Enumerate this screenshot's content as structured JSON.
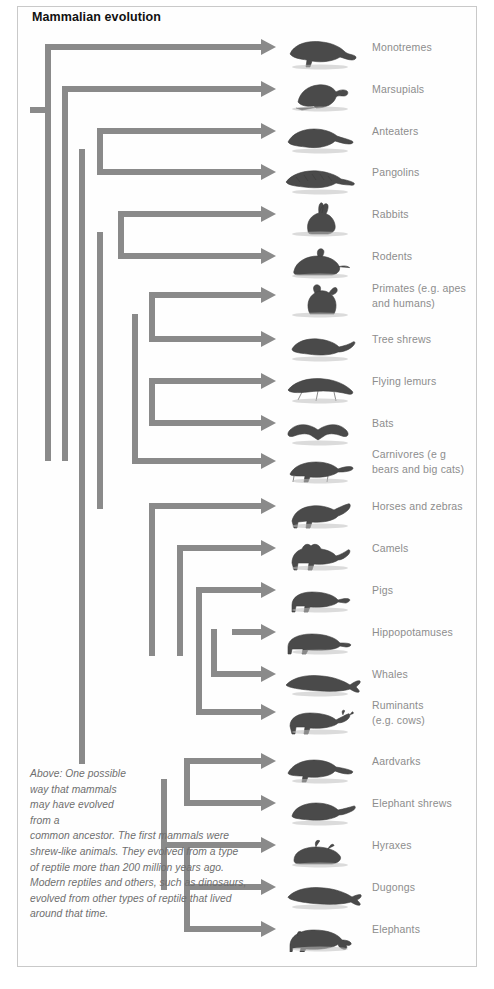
{
  "figure": {
    "title": "Mammalian evolution",
    "caption_narrow": "Above: One possible way that mammals may have evolved from a",
    "caption_rest": "common ancestor. The first mammals were shrew-like animals. They evolved from a type of reptile more than 200 million years ago. Modern reptiles and others, such as dinosaurs, evolved from other types of reptile that lived around that time.",
    "border_color": "#c9c9c9",
    "branch_color": "#8a8a8a",
    "label_color": "#8d8d8d",
    "title_color": "#111111",
    "caption_color": "#6f6f6f",
    "background": "#ffffff"
  },
  "chart_data": {
    "type": "diagram",
    "diagram_kind": "cladogram",
    "title": "Mammalian evolution",
    "taxa": [
      {
        "id": "monotremes",
        "label_line1": "Monotremes",
        "label_line2": "",
        "y": 47,
        "branch_x": 48,
        "animal": "platypus"
      },
      {
        "id": "marsupials",
        "label_line1": "Marsupials",
        "label_line2": "",
        "y": 89,
        "branch_x": 65,
        "animal": "marsupial"
      },
      {
        "id": "anteaters",
        "label_line1": "Anteaters",
        "label_line2": "",
        "y": 131,
        "branch_x": 100,
        "animal": "anteater"
      },
      {
        "id": "pangolins",
        "label_line1": "Pangolins",
        "label_line2": "",
        "y": 172,
        "branch_x": 100,
        "animal": "pangolin"
      },
      {
        "id": "rabbits",
        "label_line1": "Rabbits",
        "label_line2": "",
        "y": 214,
        "branch_x": 121,
        "animal": "rabbit"
      },
      {
        "id": "rodents",
        "label_line1": "Rodents",
        "label_line2": "",
        "y": 256,
        "branch_x": 121,
        "animal": "rodent"
      },
      {
        "id": "primates",
        "label_line1": "Primates (e.g. apes",
        "label_line2": "and humans)",
        "y": 295,
        "branch_x": 152,
        "animal": "primate"
      },
      {
        "id": "tree-shrews",
        "label_line1": "Tree shrews",
        "label_line2": "",
        "y": 339,
        "branch_x": 152,
        "animal": "treeshrew"
      },
      {
        "id": "flying-lemurs",
        "label_line1": "Flying lemurs",
        "label_line2": "",
        "y": 381,
        "branch_x": 152,
        "animal": "colugo"
      },
      {
        "id": "bats",
        "label_line1": "Bats",
        "label_line2": "",
        "y": 423,
        "branch_x": 152,
        "animal": "bat"
      },
      {
        "id": "carnivores",
        "label_line1": "Carnivores (e g",
        "label_line2": "bears and big cats)",
        "y": 461,
        "branch_x": 135,
        "animal": "cheetah"
      },
      {
        "id": "horses-zebras",
        "label_line1": "Horses and zebras",
        "label_line2": "",
        "y": 506,
        "branch_x": 152,
        "animal": "horse"
      },
      {
        "id": "camels",
        "label_line1": "Camels",
        "label_line2": "",
        "y": 548,
        "branch_x": 180,
        "animal": "camel"
      },
      {
        "id": "pigs",
        "label_line1": "Pigs",
        "label_line2": "",
        "y": 590,
        "branch_x": 199,
        "animal": "pig"
      },
      {
        "id": "hippopotamuses",
        "label_line1": "Hippopotamuses",
        "label_line2": "",
        "y": 632,
        "branch_x": 232,
        "animal": "hippo"
      },
      {
        "id": "whales",
        "label_line1": "Whales",
        "label_line2": "",
        "y": 674,
        "branch_x": 214,
        "animal": "whale"
      },
      {
        "id": "ruminants",
        "label_line1": "Ruminants",
        "label_line2": "(e.g. cows)",
        "y": 712,
        "branch_x": 199,
        "animal": "cow"
      },
      {
        "id": "aardvarks",
        "label_line1": "Aardvarks",
        "label_line2": "",
        "y": 761,
        "branch_x": 187,
        "animal": "aardvark"
      },
      {
        "id": "elephant-shrews",
        "label_line1": "Elephant shrews",
        "label_line2": "",
        "y": 803,
        "branch_x": 187,
        "animal": "elephantshrew"
      },
      {
        "id": "hyraxes",
        "label_line1": "Hyraxes",
        "label_line2": "",
        "y": 845,
        "branch_x": 164,
        "animal": "hyrax"
      },
      {
        "id": "dugongs",
        "label_line1": "Dugongs",
        "label_line2": "",
        "y": 887,
        "branch_x": 187,
        "animal": "dugong"
      },
      {
        "id": "elephants",
        "label_line1": "Elephants",
        "label_line2": "",
        "y": 929,
        "branch_x": 187,
        "animal": "elephant"
      }
    ],
    "arrow_tip_x": 276,
    "root_stub": {
      "x1": 30,
      "x2": 48,
      "y": 110
    },
    "nodes": [
      {
        "id": "root",
        "x": 48,
        "y_top": 47,
        "y_bottom": 458
      },
      {
        "id": "theria",
        "x": 65,
        "y_top": 89,
        "y_bottom": 458
      },
      {
        "id": "placentalia",
        "x": 82,
        "y_top": 152,
        "y_bottom": 761
      },
      {
        "id": "boreo",
        "x": 100,
        "y_top": 131,
        "y_bottom": 172
      },
      {
        "id": "glires-euarch",
        "x": 100,
        "y_top": 235,
        "y_bottom": 506
      },
      {
        "id": "glires",
        "x": 121,
        "y_top": 214,
        "y_bottom": 256
      },
      {
        "id": "euarchonta",
        "x": 135,
        "y_top": 317,
        "y_bottom": 461
      },
      {
        "id": "primatomorpha",
        "x": 152,
        "y_top": 295,
        "y_bottom": 339
      },
      {
        "id": "dermoptera",
        "x": 152,
        "y_top": 381,
        "y_bottom": 423
      },
      {
        "id": "laurasia",
        "x": 152,
        "y_top": 506,
        "y_bottom": 653
      },
      {
        "id": "artiodactyla",
        "x": 180,
        "y_top": 548,
        "y_bottom": 653
      },
      {
        "id": "suina-clade",
        "x": 199,
        "y_top": 590,
        "y_bottom": 712
      },
      {
        "id": "whippo",
        "x": 214,
        "y_top": 632,
        "y_bottom": 674
      },
      {
        "id": "afrotheria",
        "x": 164,
        "y_top": 782,
        "y_bottom": 887
      },
      {
        "id": "afroinsect",
        "x": 187,
        "y_top": 761,
        "y_bottom": 803
      },
      {
        "id": "paenungulata",
        "x": 187,
        "y_top": 845,
        "y_bottom": 908
      },
      {
        "id": "tethytheria",
        "x": 187,
        "y_top": 887,
        "y_bottom": 929
      }
    ]
  }
}
